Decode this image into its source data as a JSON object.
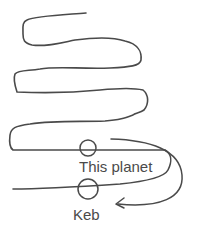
{
  "diagram": {
    "colors": {
      "line": "#4a4a4a",
      "text": "#4a4a4a",
      "background": "#ffffff"
    },
    "markers": [
      {
        "id": "this-planet",
        "label": "This planet"
      },
      {
        "id": "keb",
        "label": "Keb"
      }
    ],
    "arrow": {
      "from": "this-planet",
      "to": "keb",
      "direction": "down-and-back-left"
    }
  }
}
